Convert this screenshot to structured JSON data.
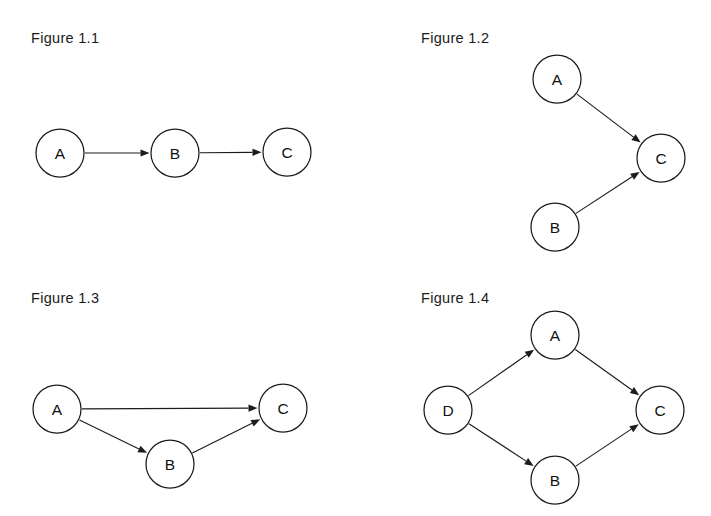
{
  "page": {
    "background_color": "#ffffff",
    "ink_color": "#1c1c1c",
    "width": 711,
    "height": 516
  },
  "figures": [
    {
      "id": "figure-1-1",
      "label": "Figure 1.1",
      "label_pos": {
        "x": 31,
        "y": 31
      },
      "node_radius": 24,
      "nodes": [
        {
          "id": "A",
          "label": "A",
          "x": 60,
          "y": 153
        },
        {
          "id": "B",
          "label": "B",
          "x": 175,
          "y": 153
        },
        {
          "id": "C",
          "label": "C",
          "x": 287,
          "y": 152
        }
      ],
      "edges": [
        {
          "from": "A",
          "to": "B",
          "directed": true
        },
        {
          "from": "B",
          "to": "C",
          "directed": true
        }
      ]
    },
    {
      "id": "figure-1-2",
      "label": "Figure 1.2",
      "label_pos": {
        "x": 421,
        "y": 31
      },
      "node_radius": 24,
      "nodes": [
        {
          "id": "A",
          "label": "A",
          "x": 557,
          "y": 79
        },
        {
          "id": "B",
          "label": "B",
          "x": 555,
          "y": 227
        },
        {
          "id": "C",
          "label": "C",
          "x": 661,
          "y": 158
        }
      ],
      "edges": [
        {
          "from": "A",
          "to": "C",
          "directed": true
        },
        {
          "from": "B",
          "to": "C",
          "directed": true
        }
      ]
    },
    {
      "id": "figure-1-3",
      "label": "Figure 1.3",
      "label_pos": {
        "x": 31,
        "y": 291
      },
      "node_radius": 24,
      "nodes": [
        {
          "id": "A",
          "label": "A",
          "x": 57,
          "y": 409
        },
        {
          "id": "B",
          "label": "B",
          "x": 170,
          "y": 464
        },
        {
          "id": "C",
          "label": "C",
          "x": 283,
          "y": 408
        }
      ],
      "edges": [
        {
          "from": "A",
          "to": "C",
          "directed": true
        },
        {
          "from": "A",
          "to": "B",
          "directed": true
        },
        {
          "from": "B",
          "to": "C",
          "directed": true
        }
      ]
    },
    {
      "id": "figure-1-4",
      "label": "Figure 1.4",
      "label_pos": {
        "x": 421,
        "y": 291
      },
      "node_radius": 24,
      "nodes": [
        {
          "id": "D",
          "label": "D",
          "x": 448,
          "y": 410
        },
        {
          "id": "A",
          "label": "A",
          "x": 555,
          "y": 335
        },
        {
          "id": "B",
          "label": "B",
          "x": 555,
          "y": 480
        },
        {
          "id": "C",
          "label": "C",
          "x": 660,
          "y": 410
        }
      ],
      "edges": [
        {
          "from": "D",
          "to": "A",
          "directed": true
        },
        {
          "from": "D",
          "to": "B",
          "directed": true
        },
        {
          "from": "A",
          "to": "C",
          "directed": true
        },
        {
          "from": "B",
          "to": "C",
          "directed": true
        }
      ]
    }
  ],
  "arrow": {
    "length": 9,
    "half_width": 3.6
  }
}
